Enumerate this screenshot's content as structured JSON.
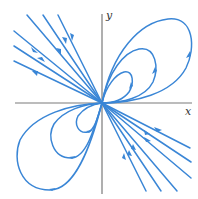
{
  "diagram": {
    "type": "phase-portrait",
    "colors": {
      "trajectory": "#3a86d6",
      "axis": "#7a7a7a",
      "label": "#333333"
    },
    "axes": {
      "x_label": "x",
      "y_label": "y"
    },
    "origin": [
      102,
      103
    ],
    "trajectories": {
      "incoming_lines_upper_left": 6,
      "outgoing_lines_lower_right": 6,
      "loops_upper_right": 3,
      "loops_lower_left": 3
    }
  }
}
